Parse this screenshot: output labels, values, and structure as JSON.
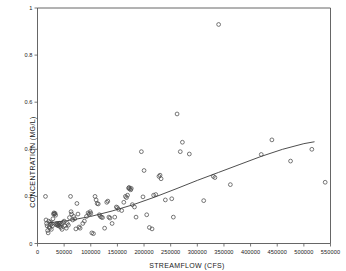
{
  "chart_data": {
    "type": "scatter",
    "title": "",
    "xlabel": "STREAMFLOW (CFS)",
    "ylabel": "CONCENTRATION (MG/L)",
    "xlim": [
      0,
      550000
    ],
    "ylim": [
      0,
      1
    ],
    "grid": false,
    "legend": null,
    "xticks": [
      0,
      50000,
      100000,
      150000,
      200000,
      250000,
      300000,
      350000,
      400000,
      450000,
      500000,
      550000
    ],
    "xtick_labels": [
      "0",
      "50000",
      "100000",
      "150000",
      "200000",
      "250000",
      "300000",
      "350000",
      "400000",
      "450000",
      "500000",
      "550000"
    ],
    "yticks": [
      0,
      0.2,
      0.4,
      0.6,
      0.8,
      1
    ],
    "ytick_labels": [
      "0",
      "0.2",
      "0.4",
      "0.6",
      "0.8",
      "1"
    ],
    "marker": "open-circle",
    "marker_color": "#4a4a4a",
    "series": [
      {
        "name": "observations",
        "points": [
          [
            15000,
            0.2
          ],
          [
            16000,
            0.1
          ],
          [
            17000,
            0.085
          ],
          [
            18000,
            0.075
          ],
          [
            19000,
            0.055
          ],
          [
            20000,
            0.045
          ],
          [
            21000,
            0.095
          ],
          [
            22000,
            0.07
          ],
          [
            23000,
            0.065
          ],
          [
            24000,
            0.09
          ],
          [
            25000,
            0.08
          ],
          [
            26000,
            0.06
          ],
          [
            27000,
            0.085
          ],
          [
            28000,
            0.075
          ],
          [
            29000,
            0.105
          ],
          [
            30000,
            0.125
          ],
          [
            31000,
            0.13
          ],
          [
            32000,
            0.125
          ],
          [
            33000,
            0.128
          ],
          [
            34000,
            0.12
          ],
          [
            35000,
            0.08
          ],
          [
            36000,
            0.085
          ],
          [
            37000,
            0.078
          ],
          [
            38000,
            0.082
          ],
          [
            39000,
            0.075
          ],
          [
            40000,
            0.08
          ],
          [
            41000,
            0.086
          ],
          [
            42000,
            0.073
          ],
          [
            43000,
            0.079
          ],
          [
            44000,
            0.068
          ],
          [
            45000,
            0.083
          ],
          [
            46000,
            0.06
          ],
          [
            48000,
            0.09
          ],
          [
            50000,
            0.095
          ],
          [
            52000,
            0.075
          ],
          [
            54000,
            0.065
          ],
          [
            56000,
            0.085
          ],
          [
            58000,
            0.078
          ],
          [
            60000,
            0.11
          ],
          [
            62000,
            0.2
          ],
          [
            63000,
            0.135
          ],
          [
            64000,
            0.125
          ],
          [
            66000,
            0.1
          ],
          [
            68000,
            0.115
          ],
          [
            70000,
            0.105
          ],
          [
            72000,
            0.062
          ],
          [
            74000,
            0.17
          ],
          [
            76000,
            0.125
          ],
          [
            78000,
            0.07
          ],
          [
            80000,
            0.065
          ],
          [
            85000,
            0.085
          ],
          [
            88000,
            0.095
          ],
          [
            92000,
            0.115
          ],
          [
            95000,
            0.13
          ],
          [
            97000,
            0.125
          ],
          [
            99000,
            0.135
          ],
          [
            100000,
            0.128
          ],
          [
            102000,
            0.045
          ],
          [
            105000,
            0.042
          ],
          [
            108000,
            0.2
          ],
          [
            110000,
            0.185
          ],
          [
            112000,
            0.17
          ],
          [
            114000,
            0.168
          ],
          [
            116000,
            0.122
          ],
          [
            118000,
            0.115
          ],
          [
            120000,
            0.112
          ],
          [
            122000,
            0.11
          ],
          [
            126000,
            0.065
          ],
          [
            130000,
            0.175
          ],
          [
            132000,
            0.18
          ],
          [
            134000,
            0.112
          ],
          [
            136000,
            0.108
          ],
          [
            140000,
            0.085
          ],
          [
            145000,
            0.112
          ],
          [
            148000,
            0.155
          ],
          [
            150000,
            0.152
          ],
          [
            152000,
            0.145
          ],
          [
            158000,
            0.14
          ],
          [
            162000,
            0.175
          ],
          [
            165000,
            0.2
          ],
          [
            167000,
            0.195
          ],
          [
            169000,
            0.205
          ],
          [
            171000,
            0.235
          ],
          [
            172000,
            0.238
          ],
          [
            173000,
            0.232
          ],
          [
            175000,
            0.228
          ],
          [
            176000,
            0.234
          ],
          [
            178000,
            0.165
          ],
          [
            182000,
            0.155
          ],
          [
            185000,
            0.112
          ],
          [
            195000,
            0.39
          ],
          [
            198000,
            0.198
          ],
          [
            200000,
            0.31
          ],
          [
            205000,
            0.122
          ],
          [
            210000,
            0.068
          ],
          [
            215000,
            0.062
          ],
          [
            218000,
            0.205
          ],
          [
            222000,
            0.208
          ],
          [
            228000,
            0.285
          ],
          [
            230000,
            0.29
          ],
          [
            232000,
            0.275
          ],
          [
            240000,
            0.185
          ],
          [
            252000,
            0.19
          ],
          [
            255000,
            0.112
          ],
          [
            262000,
            0.55
          ],
          [
            268000,
            0.39
          ],
          [
            272000,
            0.43
          ],
          [
            285000,
            0.38
          ],
          [
            312000,
            0.182
          ],
          [
            330000,
            0.285
          ],
          [
            333000,
            0.28
          ],
          [
            340000,
            0.93
          ],
          [
            362000,
            0.25
          ],
          [
            420000,
            0.378
          ],
          [
            440000,
            0.44
          ],
          [
            475000,
            0.35
          ],
          [
            515000,
            0.4
          ],
          [
            540000,
            0.26
          ]
        ]
      }
    ],
    "trend_line": {
      "name": "fitted-curve",
      "color": "#3a3a3a",
      "points": [
        [
          22000,
          0.088
        ],
        [
          60000,
          0.098
        ],
        [
          100000,
          0.115
        ],
        [
          140000,
          0.138
        ],
        [
          180000,
          0.165
        ],
        [
          220000,
          0.197
        ],
        [
          260000,
          0.232
        ],
        [
          300000,
          0.268
        ],
        [
          340000,
          0.302
        ],
        [
          380000,
          0.336
        ],
        [
          420000,
          0.37
        ],
        [
          460000,
          0.4
        ],
        [
          500000,
          0.424
        ],
        [
          520000,
          0.432
        ]
      ]
    }
  }
}
